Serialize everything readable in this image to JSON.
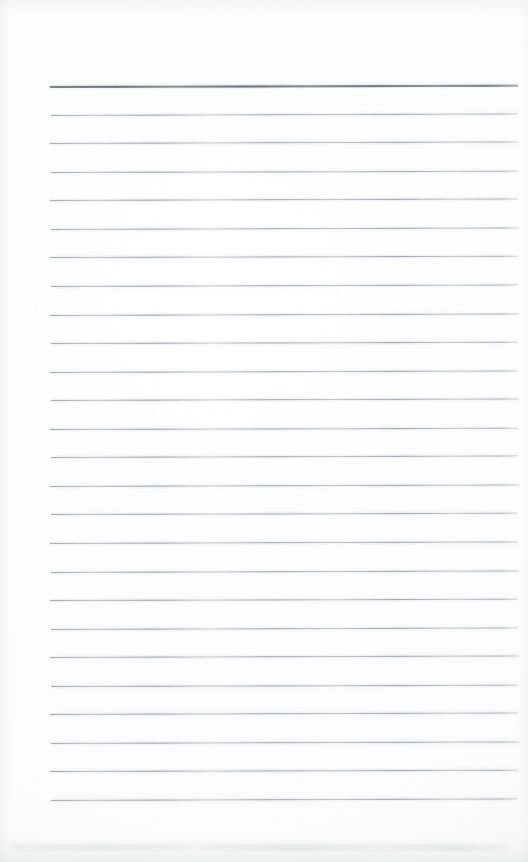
{
  "document": {
    "kind": "scanned-ruled-page",
    "description": "Blank scanned lined notebook page with no handwriting or printed text",
    "page_width": 528,
    "page_height": 862,
    "orientation": "portrait",
    "text_content": "",
    "visible_text_count": 0
  },
  "paper": {
    "background_color": "#fdfdfd",
    "highlight_color": "#ffffff",
    "shade_color": "#f8f8f8",
    "edge_shadow_color": "#9a9ea3"
  },
  "ruling": {
    "line_count": 26,
    "first_line_y": 86,
    "last_line_y": 800,
    "spacing": 28.56,
    "left_x": 50,
    "right_x": 518,
    "body_line_color": "#9a9ea5",
    "header_line_color": "#6e737a",
    "body_line_thickness": 1,
    "header_line_thickness": 2,
    "tilt_degrees": -0.18,
    "lines": [
      {
        "index": 1,
        "y": 86.0,
        "role": "header",
        "x1": 50,
        "x2": 518,
        "tilt": -0.16
      },
      {
        "index": 2,
        "y": 114.6,
        "role": "body",
        "x1": 51,
        "x2": 518,
        "tilt": -0.2
      },
      {
        "index": 3,
        "y": 143.1,
        "role": "body",
        "x1": 50,
        "x2": 519,
        "tilt": -0.18
      },
      {
        "index": 4,
        "y": 171.7,
        "role": "body",
        "x1": 51,
        "x2": 518,
        "tilt": -0.17
      },
      {
        "index": 5,
        "y": 200.2,
        "role": "body",
        "x1": 50,
        "x2": 518,
        "tilt": -0.19
      },
      {
        "index": 6,
        "y": 228.8,
        "role": "body",
        "x1": 51,
        "x2": 519,
        "tilt": -0.18
      },
      {
        "index": 7,
        "y": 257.4,
        "role": "body",
        "x1": 50,
        "x2": 518,
        "tilt": -0.16
      },
      {
        "index": 8,
        "y": 285.9,
        "role": "body",
        "x1": 51,
        "x2": 518,
        "tilt": -0.2
      },
      {
        "index": 9,
        "y": 314.5,
        "role": "body",
        "x1": 50,
        "x2": 519,
        "tilt": -0.18
      },
      {
        "index": 10,
        "y": 343.0,
        "role": "body",
        "x1": 51,
        "x2": 518,
        "tilt": -0.17
      },
      {
        "index": 11,
        "y": 371.6,
        "role": "body",
        "x1": 50,
        "x2": 518,
        "tilt": -0.19
      },
      {
        "index": 12,
        "y": 400.2,
        "role": "body",
        "x1": 51,
        "x2": 519,
        "tilt": -0.18
      },
      {
        "index": 13,
        "y": 428.7,
        "role": "body",
        "x1": 50,
        "x2": 518,
        "tilt": -0.16
      },
      {
        "index": 14,
        "y": 457.3,
        "role": "body",
        "x1": 51,
        "x2": 518,
        "tilt": -0.2
      },
      {
        "index": 15,
        "y": 485.8,
        "role": "body",
        "x1": 50,
        "x2": 519,
        "tilt": -0.18
      },
      {
        "index": 16,
        "y": 514.4,
        "role": "body",
        "x1": 51,
        "x2": 518,
        "tilt": -0.17
      },
      {
        "index": 17,
        "y": 543.0,
        "role": "body",
        "x1": 50,
        "x2": 518,
        "tilt": -0.19
      },
      {
        "index": 18,
        "y": 571.5,
        "role": "body",
        "x1": 51,
        "x2": 519,
        "tilt": -0.18
      },
      {
        "index": 19,
        "y": 600.1,
        "role": "body",
        "x1": 50,
        "x2": 518,
        "tilt": -0.16
      },
      {
        "index": 20,
        "y": 628.6,
        "role": "body",
        "x1": 51,
        "x2": 518,
        "tilt": -0.2
      },
      {
        "index": 21,
        "y": 657.2,
        "role": "body",
        "x1": 50,
        "x2": 519,
        "tilt": -0.18
      },
      {
        "index": 22,
        "y": 685.8,
        "role": "body",
        "x1": 51,
        "x2": 518,
        "tilt": -0.17
      },
      {
        "index": 23,
        "y": 714.3,
        "role": "body",
        "x1": 50,
        "x2": 518,
        "tilt": -0.19
      },
      {
        "index": 24,
        "y": 742.9,
        "role": "body",
        "x1": 51,
        "x2": 519,
        "tilt": -0.18
      },
      {
        "index": 25,
        "y": 771.4,
        "role": "body",
        "x1": 50,
        "x2": 518,
        "tilt": -0.16
      },
      {
        "index": 26,
        "y": 800.0,
        "role": "body",
        "x1": 51,
        "x2": 518,
        "tilt": -0.2
      }
    ]
  },
  "margins": {
    "top_blank_height": 86,
    "bottom_blank_height": 62,
    "left_margin": 50,
    "right_margin": 10
  }
}
